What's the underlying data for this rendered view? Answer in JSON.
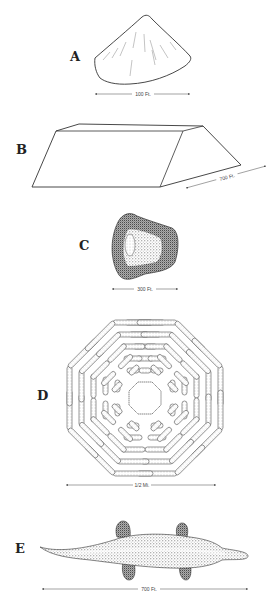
{
  "figures": [
    {
      "id": "A",
      "label": "A",
      "shape": "conical-mound",
      "scale": "100 Ft."
    },
    {
      "id": "B",
      "label": "B",
      "shape": "truncated-prism-mound",
      "scale": "700 Ft."
    },
    {
      "id": "C",
      "label": "C",
      "shape": "stippled-enclosure-mound",
      "scale": "300 Ft."
    },
    {
      "id": "D",
      "label": "D",
      "shape": "octagonal-concentric-ridges",
      "scale": "1/2 Mi."
    },
    {
      "id": "E",
      "label": "E",
      "shape": "alligator-effigy-mound",
      "scale": "700 Ft."
    }
  ],
  "colors": {
    "ink": "#333333",
    "stipple": "#555555",
    "background": "#ffffff"
  }
}
